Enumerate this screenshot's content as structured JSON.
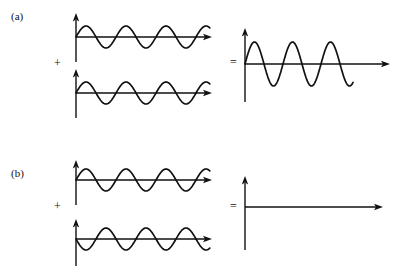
{
  "figure": {
    "title_visible": false,
    "background_color": "#ffffff",
    "stroke_color": "#111111"
  },
  "panels": [
    {
      "id": "a",
      "label": "(a)",
      "label_x": 11,
      "label_y": 10,
      "operator_plus": "+",
      "operator_plus_x": 54,
      "operator_plus_y": 57,
      "operator_equals": "=",
      "operator_equals_x": 230,
      "operator_equals_y": 56,
      "inputs": [
        {
          "name": "wave-a-input-1",
          "origin_x": 76,
          "origin_y": 37,
          "axis_length": 136,
          "axis_top": 13,
          "axis_bottom": 62,
          "amplitude": 11,
          "period": 40,
          "phase_deg": 0,
          "cycles": 3.1,
          "wave_length": 134
        },
        {
          "name": "wave-a-input-2",
          "origin_x": 76,
          "origin_y": 93,
          "axis_length": 136,
          "axis_top": 69,
          "axis_bottom": 118,
          "amplitude": 11,
          "period": 40,
          "phase_deg": 0,
          "cycles": 3.1,
          "wave_length": 134
        }
      ],
      "result": {
        "name": "wave-a-result",
        "origin_x": 245,
        "origin_y": 64,
        "axis_length": 145,
        "axis_top": 28,
        "axis_bottom": 102,
        "amplitude": 22,
        "period": 38,
        "phase_deg": 0,
        "cycles": 2.85,
        "wave_length": 108,
        "interference": "constructive"
      }
    },
    {
      "id": "b",
      "label": "(b)",
      "label_x": 11,
      "label_y": 167,
      "operator_plus": "+",
      "operator_plus_x": 54,
      "operator_plus_y": 200,
      "operator_equals": "=",
      "operator_equals_x": 230,
      "operator_equals_y": 200,
      "inputs": [
        {
          "name": "wave-b-input-1",
          "origin_x": 76,
          "origin_y": 180,
          "axis_length": 136,
          "axis_top": 160,
          "axis_bottom": 205,
          "amplitude": 11,
          "period": 40,
          "phase_deg": 0,
          "cycles": 3.1,
          "wave_length": 134
        },
        {
          "name": "wave-b-input-2",
          "origin_x": 76,
          "origin_y": 239,
          "axis_length": 136,
          "axis_top": 219,
          "axis_bottom": 266,
          "amplitude": 11,
          "period": 40,
          "phase_deg": 180,
          "cycles": 3.1,
          "wave_length": 134
        }
      ],
      "result": {
        "name": "wave-b-result",
        "origin_x": 245,
        "origin_y": 207,
        "axis_length": 138,
        "axis_top": 176,
        "axis_bottom": 250,
        "amplitude": 0,
        "period": 38,
        "phase_deg": 0,
        "cycles": 0,
        "wave_length": 0,
        "interference": "destructive"
      }
    }
  ],
  "chart_data": {
    "type": "line",
    "title": "",
    "xlabel": "",
    "ylabel": "",
    "grid": false,
    "legend": "none",
    "series": [
      {
        "name": "(a) input wave 1",
        "waveform": "sine",
        "amplitude": 1,
        "phase_deg": 0,
        "cycles": 3.1
      },
      {
        "name": "(a) input wave 2",
        "waveform": "sine",
        "amplitude": 1,
        "phase_deg": 0,
        "cycles": 3.1
      },
      {
        "name": "(a) resultant",
        "waveform": "sine",
        "amplitude": 2,
        "phase_deg": 0,
        "cycles": 2.85
      },
      {
        "name": "(b) input wave 1",
        "waveform": "sine",
        "amplitude": 1,
        "phase_deg": 0,
        "cycles": 3.1
      },
      {
        "name": "(b) input wave 2",
        "waveform": "sine",
        "amplitude": 1,
        "phase_deg": 180,
        "cycles": 3.1
      },
      {
        "name": "(b) resultant",
        "waveform": "flat",
        "amplitude": 0,
        "phase_deg": 0,
        "cycles": 0
      }
    ]
  }
}
